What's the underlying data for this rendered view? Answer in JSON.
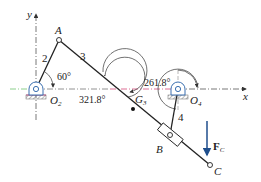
{
  "diagram": {
    "type": "four-bar linkage (mechanism diagram)",
    "axes": {
      "x_label": "x",
      "y_label": "y"
    },
    "points": {
      "O2": {
        "label": "O",
        "sub": "2"
      },
      "O4": {
        "label": "O",
        "sub": "4"
      },
      "A": {
        "label": "A"
      },
      "B": {
        "label": "B"
      },
      "C": {
        "label": "C"
      },
      "G3": {
        "label": "G",
        "sub": "3"
      }
    },
    "links": [
      {
        "id": "2",
        "label": "2"
      },
      {
        "id": "3",
        "label": "3"
      },
      {
        "id": "4",
        "label": "4"
      }
    ],
    "angles": [
      {
        "name": "theta2",
        "label": "60°"
      },
      {
        "name": "theta3",
        "label": "321.8°"
      },
      {
        "name": "theta4",
        "label": "261.8°"
      }
    ],
    "force": {
      "label": "F",
      "sub": "C",
      "color": "#1f4e8c"
    },
    "colors": {
      "axis_line": "#444444",
      "ground_line_left": "#6fc36f",
      "ground_line_mid": "#d44a7a",
      "pivot_fill": "#3a6fb0",
      "hatch": "#7a7a7a",
      "link": "#222222"
    }
  }
}
